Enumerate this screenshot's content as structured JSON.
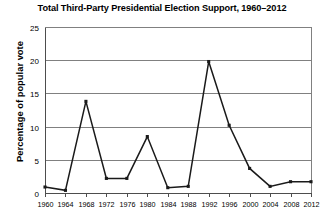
{
  "chart_data": {
    "type": "line",
    "title": "Total Third-Party Presidential Election Support, 1960–2012",
    "xlabel": "",
    "ylabel": "Percentage of popular vote",
    "x": [
      1960,
      1964,
      1968,
      1972,
      1976,
      1980,
      1984,
      1988,
      1992,
      1996,
      2000,
      2004,
      2008,
      2012
    ],
    "values": [
      0.9,
      0.4,
      13.8,
      2.2,
      2.2,
      8.5,
      0.8,
      1.0,
      19.8,
      10.2,
      3.7,
      1.0,
      1.7,
      1.7
    ],
    "categories": [
      "1960",
      "1964",
      "1968",
      "1972",
      "1976",
      "1980",
      "1984",
      "1988",
      "1992",
      "1996",
      "2000",
      "2004",
      "2008",
      "2012"
    ],
    "xtick_labels": [
      "1960",
      "1964",
      "1968",
      "1972",
      "1976",
      "1980",
      "1984",
      "1988",
      "1992",
      "1996",
      "2000",
      "2004",
      "2008",
      "2012"
    ],
    "ytick_labels": [
      "0",
      "5",
      "10",
      "15",
      "20",
      "25"
    ],
    "yticks": [
      0,
      5,
      10,
      15,
      20,
      25
    ],
    "ylim": [
      0,
      25
    ],
    "xlim": [
      1958,
      2014
    ],
    "grid": "horizontal",
    "legend": "none",
    "series_color": "#1a1a1a",
    "grid_color": "#808080",
    "background_color": "#ffffff"
  }
}
